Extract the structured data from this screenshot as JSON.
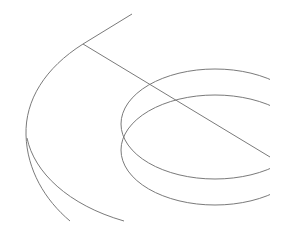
{
  "diagram": {
    "title": "",
    "background": "#ffffff",
    "stroke_color": "#7a7a7a",
    "stroke_width": 1,
    "elements": [
      {
        "id": "top-line",
        "type": "line",
        "x1": 132,
        "y1": 14,
        "x2": 83,
        "y2": 44
      },
      {
        "id": "diagonal-line",
        "type": "line",
        "x1": 83,
        "y1": 44,
        "x2": 270,
        "y2": 157
      },
      {
        "id": "outer-arc",
        "type": "path",
        "d": "M83,44 C45,68 25,100 26,135 C27,170 45,200 70,221"
      },
      {
        "id": "outer-arc-lower",
        "type": "path",
        "d": "M27,138 C34,172 68,205 124,221"
      },
      {
        "id": "upper-ellipse",
        "type": "ellipse",
        "cx": 215,
        "cy": 124,
        "rx": 94,
        "ry": 55
      },
      {
        "id": "lower-ellipse",
        "type": "ellipse",
        "cx": 215,
        "cy": 150,
        "rx": 94,
        "ry": 55
      }
    ],
    "clip": {
      "x": 0,
      "y": 0,
      "width": 270,
      "height": 236
    }
  }
}
